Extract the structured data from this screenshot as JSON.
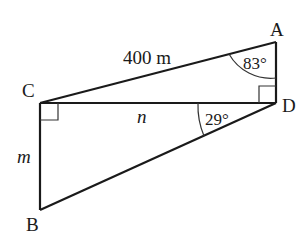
{
  "diagram": {
    "points": {
      "A": {
        "label": "A",
        "x": 276,
        "y": 42
      },
      "B": {
        "label": "B",
        "x": 40,
        "y": 210
      },
      "C": {
        "label": "C",
        "x": 40,
        "y": 103
      },
      "D": {
        "label": "D",
        "x": 276,
        "y": 103
      }
    },
    "segments": [
      {
        "from": "A",
        "to": "C",
        "label": "400 m"
      },
      {
        "from": "C",
        "to": "D",
        "label": "n"
      },
      {
        "from": "C",
        "to": "B",
        "label": "m"
      },
      {
        "from": "B",
        "to": "D",
        "label": ""
      },
      {
        "from": "A",
        "to": "D",
        "label": ""
      }
    ],
    "angles": {
      "A": "83°",
      "D": "29°"
    },
    "right_angles": [
      "C",
      "D"
    ],
    "colors": {
      "stroke": "#1a1a1a",
      "background": "#ffffff"
    }
  }
}
